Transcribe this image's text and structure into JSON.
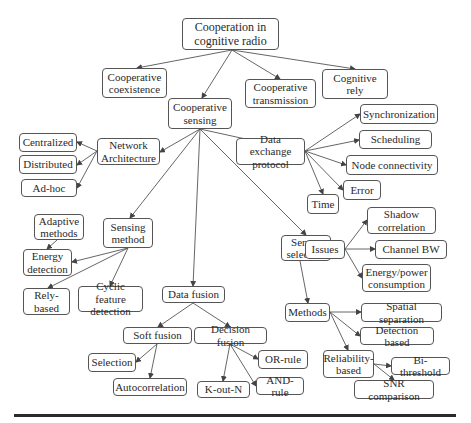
{
  "diagram": {
    "title": "Cooperation in cognitive radio",
    "nodes": [
      {
        "id": "root",
        "label": "Cooperation in\ncognitive radio",
        "x": 182,
        "y": 18,
        "w": 97,
        "h": 32
      },
      {
        "id": "coexistence",
        "label": "Cooperative\ncoexistence",
        "x": 102,
        "y": 68,
        "w": 65,
        "h": 30
      },
      {
        "id": "sensing",
        "label": "Cooperative\nsensing",
        "x": 168,
        "y": 98,
        "w": 64,
        "h": 31
      },
      {
        "id": "transmission",
        "label": "Cooperative\ntransmission",
        "x": 245,
        "y": 79,
        "w": 71,
        "h": 29
      },
      {
        "id": "rely",
        "label": "Cognitive rely",
        "x": 322,
        "y": 69,
        "w": 66,
        "h": 30
      },
      {
        "id": "netarch",
        "label": "Network\nArchitecture",
        "x": 97,
        "y": 138,
        "w": 63,
        "h": 27
      },
      {
        "id": "centralized",
        "label": "Centralized",
        "x": 19,
        "y": 133,
        "w": 58,
        "h": 19
      },
      {
        "id": "distributed",
        "label": "Distributed",
        "x": 19,
        "y": 155,
        "w": 58,
        "h": 19
      },
      {
        "id": "adhoc",
        "label": "Ad-hoc",
        "x": 21,
        "y": 179,
        "w": 56,
        "h": 18
      },
      {
        "id": "dataex",
        "label": "Data exchange\nprotocol",
        "x": 236,
        "y": 138,
        "w": 69,
        "h": 27
      },
      {
        "id": "sync",
        "label": "Synchronization",
        "x": 360,
        "y": 104,
        "w": 78,
        "h": 20
      },
      {
        "id": "sched",
        "label": "Scheduling",
        "x": 359,
        "y": 130,
        "w": 73,
        "h": 19
      },
      {
        "id": "nodeconn",
        "label": "Node connectivity",
        "x": 346,
        "y": 155,
        "w": 92,
        "h": 20
      },
      {
        "id": "error",
        "label": "Error",
        "x": 343,
        "y": 180,
        "w": 38,
        "h": 20
      },
      {
        "id": "time",
        "label": "Time",
        "x": 307,
        "y": 194,
        "w": 32,
        "h": 20
      },
      {
        "id": "sensmethod",
        "label": "Sensing\nmethod",
        "x": 103,
        "y": 218,
        "w": 50,
        "h": 30
      },
      {
        "id": "adaptive",
        "label": "Adaptive\nmethods",
        "x": 34,
        "y": 214,
        "w": 50,
        "h": 26
      },
      {
        "id": "energy",
        "label": "Energy\ndetection",
        "x": 23,
        "y": 249,
        "w": 49,
        "h": 27
      },
      {
        "id": "relybased",
        "label": "Rely-\nbased",
        "x": 23,
        "y": 288,
        "w": 47,
        "h": 27
      },
      {
        "id": "cyclic",
        "label": "Cyclic feature\ndetection",
        "x": 78,
        "y": 286,
        "w": 65,
        "h": 26
      },
      {
        "id": "datafusion",
        "label": "Data fusion",
        "x": 162,
        "y": 286,
        "w": 63,
        "h": 17
      },
      {
        "id": "soft",
        "label": "Soft fusion",
        "x": 123,
        "y": 327,
        "w": 69,
        "h": 17
      },
      {
        "id": "decision",
        "label": "Decision fusion",
        "x": 194,
        "y": 327,
        "w": 73,
        "h": 17
      },
      {
        "id": "selection",
        "label": "Selection",
        "x": 88,
        "y": 353,
        "w": 48,
        "h": 19
      },
      {
        "id": "autocorr",
        "label": "Autocorrelation",
        "x": 113,
        "y": 378,
        "w": 74,
        "h": 18
      },
      {
        "id": "koutn",
        "label": "K-out-N",
        "x": 197,
        "y": 381,
        "w": 53,
        "h": 17
      },
      {
        "id": "orrule",
        "label": "OR-rule",
        "x": 258,
        "y": 350,
        "w": 50,
        "h": 19
      },
      {
        "id": "andrule",
        "label": "AND-rule",
        "x": 256,
        "y": 377,
        "w": 48,
        "h": 18
      },
      {
        "id": "sensorsel",
        "label": "Sensor\nselection",
        "x": 281,
        "y": 235,
        "w": 50,
        "h": 26
      },
      {
        "id": "issues",
        "label": "Issues",
        "x": 305,
        "y": 240,
        "w": 40,
        "h": 19
      },
      {
        "id": "shadow",
        "label": "Shadow\ncorrelation",
        "x": 367,
        "y": 207,
        "w": 69,
        "h": 27
      },
      {
        "id": "channelbw",
        "label": "Channel BW",
        "x": 375,
        "y": 240,
        "w": 72,
        "h": 19
      },
      {
        "id": "energypower",
        "label": "Energy/power\nconsumption",
        "x": 362,
        "y": 264,
        "w": 69,
        "h": 28
      },
      {
        "id": "methods",
        "label": "Methods",
        "x": 285,
        "y": 303,
        "w": 45,
        "h": 19
      },
      {
        "id": "spatial",
        "label": "Spatial separation",
        "x": 361,
        "y": 303,
        "w": 81,
        "h": 19
      },
      {
        "id": "detbased",
        "label": "Detection based",
        "x": 360,
        "y": 327,
        "w": 74,
        "h": 18
      },
      {
        "id": "reliability",
        "label": "Reliability-\nbased",
        "x": 323,
        "y": 350,
        "w": 51,
        "h": 28
      },
      {
        "id": "bithresh",
        "label": "Bi-threshold",
        "x": 391,
        "y": 357,
        "w": 59,
        "h": 18
      },
      {
        "id": "snr",
        "label": "SNR comparison",
        "x": 354,
        "y": 380,
        "w": 80,
        "h": 19
      }
    ],
    "edges": [
      [
        232,
        50,
        137,
        68
      ],
      [
        232,
        50,
        202,
        98
      ],
      [
        232,
        50,
        280,
        79
      ],
      [
        232,
        50,
        355,
        69
      ],
      [
        200,
        129,
        160,
        152
      ],
      [
        200,
        129,
        300,
        151
      ],
      [
        200,
        129,
        130,
        218
      ],
      [
        200,
        129,
        193,
        286
      ],
      [
        200,
        129,
        306,
        235
      ],
      [
        97,
        151,
        77,
        142
      ],
      [
        97,
        151,
        77,
        165
      ],
      [
        97,
        151,
        77,
        188
      ],
      [
        305,
        151,
        360,
        114
      ],
      [
        305,
        151,
        359,
        140
      ],
      [
        305,
        151,
        346,
        165
      ],
      [
        305,
        151,
        343,
        190
      ],
      [
        305,
        151,
        323,
        194
      ],
      [
        57,
        240,
        47,
        249
      ],
      [
        128,
        248,
        72,
        262
      ],
      [
        128,
        248,
        48,
        288
      ],
      [
        128,
        248,
        110,
        286
      ],
      [
        193,
        303,
        158,
        327
      ],
      [
        193,
        303,
        230,
        327
      ],
      [
        157,
        344,
        136,
        362
      ],
      [
        157,
        344,
        150,
        378
      ],
      [
        230,
        344,
        223,
        381
      ],
      [
        230,
        344,
        258,
        359
      ],
      [
        230,
        344,
        256,
        386
      ],
      [
        331,
        248,
        305,
        249
      ],
      [
        345,
        249,
        367,
        220
      ],
      [
        345,
        249,
        375,
        249
      ],
      [
        345,
        249,
        362,
        278
      ],
      [
        300,
        261,
        308,
        303
      ],
      [
        330,
        312,
        361,
        312
      ],
      [
        330,
        312,
        360,
        336
      ],
      [
        330,
        312,
        348,
        350
      ],
      [
        374,
        364,
        391,
        366
      ],
      [
        374,
        364,
        394,
        380
      ]
    ]
  },
  "colors": {
    "line": "#555555",
    "border": "#555555",
    "text": "#2a2a2a",
    "rule": "#2b2b2b"
  }
}
